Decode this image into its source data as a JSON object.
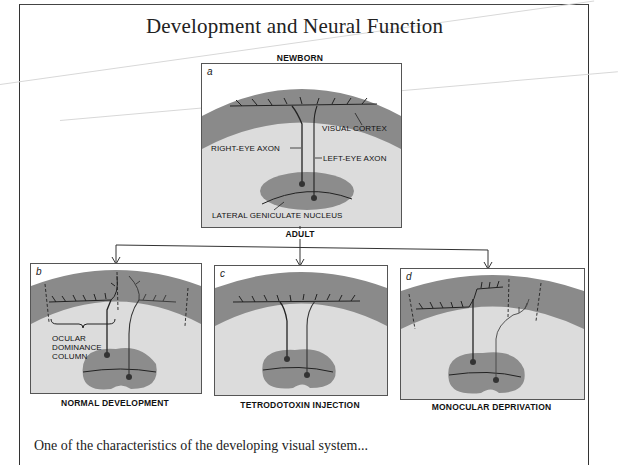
{
  "page": {
    "title": "Development and Neural Function",
    "body_text_partial": "One of the characteristics of the developing visual system..."
  },
  "figure": {
    "stages": {
      "top": "NEWBORN",
      "middle": "ADULT"
    },
    "panels": [
      {
        "letter": "a",
        "caption": "",
        "annotations": {
          "visual_cortex": "VISUAL CORTEX",
          "right_eye_axon": "RIGHT-EYE AXON",
          "left_eye_axon": "LEFT-EYE AXON",
          "lgn": "LATERAL GENICULATE NUCLEUS"
        }
      },
      {
        "letter": "b",
        "caption": "NORMAL DEVELOPMENT",
        "annotations": {
          "odc_line1": "OCULAR",
          "odc_line2": "DOMINANCE",
          "odc_line3": "COLUMN"
        }
      },
      {
        "letter": "c",
        "caption": "TETRODOTOXIN INJECTION"
      },
      {
        "letter": "d",
        "caption": "MONOCULAR DEPRIVATION"
      }
    ],
    "colors": {
      "cortex": "#8a8a8a",
      "white_matter": "#dcdcdc",
      "lgn": "#8c8c8c",
      "axon": "#222222"
    }
  }
}
